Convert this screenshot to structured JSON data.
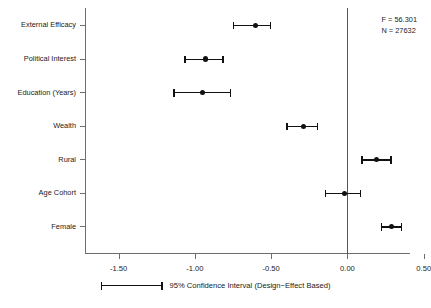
{
  "chart_data": {
    "type": "scatter",
    "title": "",
    "subtitle": "",
    "xlabel": "",
    "ylabel": "",
    "xlim": [
      -1.72,
      0.41
    ],
    "xticks": [
      -1.5,
      -1.0,
      -0.5,
      0.0,
      0.5
    ],
    "xtick_labels": [
      "-1.50",
      "-1.00",
      "-0.50",
      "0.00",
      "0.50"
    ],
    "grid": false,
    "zero_reference_line": 0.0,
    "legend_position": "bottom-center",
    "orientation": "horizontal",
    "categories": [
      "External Efficacy",
      "Political Interest",
      "Education (Years)",
      "Wealth",
      "Rural",
      "Age Cohort",
      "Female"
    ],
    "series": [
      {
        "name": "95% Confidence Interval (Design-Effect Based)",
        "estimates": [
          -0.6,
          -0.93,
          -0.95,
          -0.29,
          0.19,
          -0.02,
          0.29
        ],
        "ci_low": [
          -0.75,
          -1.07,
          -1.14,
          -0.4,
          0.09,
          -0.15,
          0.22
        ],
        "ci_high": [
          -0.5,
          -0.81,
          -0.76,
          -0.19,
          0.29,
          0.09,
          0.36
        ]
      }
    ],
    "annotations": {
      "f_statistic": "F = 56.301",
      "n_observations": "N = 27632"
    },
    "legend": {
      "label": "95% Confidence Interval (Design−Effect Based)"
    },
    "colors": {
      "marker": "#111111",
      "whisker": "#111111",
      "axis": "#6e6e6e",
      "zero_line": "#555555",
      "background": "#ffffff",
      "text": "#1a1a1a"
    }
  }
}
